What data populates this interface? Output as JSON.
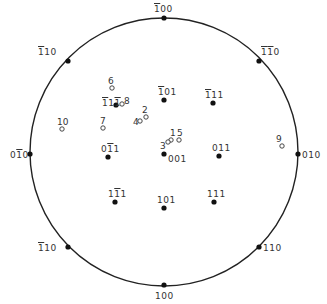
{
  "diagram": {
    "type": "stereographic-projection",
    "circle": {
      "cx": 164,
      "cy": 152,
      "r": 134,
      "stroke": "#222222"
    },
    "poles": [
      {
        "id": "p-100bar",
        "parts": [
          [
            "1",
            true
          ],
          [
            "00",
            false
          ]
        ],
        "x": 164,
        "y": 18,
        "lx": 154,
        "ly": 5
      },
      {
        "id": "p-1bar10",
        "parts": [
          [
            "1",
            true
          ],
          [
            "10",
            false
          ]
        ],
        "x": 68,
        "y": 61,
        "lx": 38,
        "ly": 48
      },
      {
        "id": "p-1bar1bar0",
        "parts": [
          [
            "1",
            true
          ],
          [
            "1",
            true
          ],
          [
            "0",
            false
          ]
        ],
        "x": 259,
        "y": 61,
        "lx": 261,
        "ly": 48
      },
      {
        "id": "p-010bar",
        "parts": [
          [
            "0",
            false
          ],
          [
            "1",
            true
          ],
          [
            "0",
            false
          ]
        ],
        "x": 30,
        "y": 154,
        "lx": 10,
        "ly": 151
      },
      {
        "id": "p-010",
        "parts": [
          [
            "010",
            false
          ]
        ],
        "x": 298,
        "y": 154,
        "lx": 302,
        "ly": 151
      },
      {
        "id": "p-11bar0",
        "parts": [
          [
            "1",
            true
          ],
          [
            "10",
            false
          ]
        ],
        "x": 68,
        "y": 247,
        "lx": 38,
        "ly": 244
      },
      {
        "id": "p-110",
        "parts": [
          [
            "110",
            false
          ]
        ],
        "x": 259,
        "y": 247,
        "lx": 263,
        "ly": 244
      },
      {
        "id": "p-100",
        "parts": [
          [
            "100",
            false
          ]
        ],
        "x": 164,
        "y": 285,
        "lx": 155,
        "ly": 292
      },
      {
        "id": "p-1bar11bar",
        "parts": [
          [
            "1",
            true
          ],
          [
            "1",
            false
          ],
          [
            "1",
            true
          ]
        ],
        "x": 116,
        "y": 105,
        "lx": 102,
        "ly": 99
      },
      {
        "id": "p-1bar01",
        "parts": [
          [
            "1",
            true
          ],
          [
            "01",
            false
          ]
        ],
        "x": 164,
        "y": 100,
        "lx": 158,
        "ly": 88
      },
      {
        "id": "p-1bar11",
        "parts": [
          [
            "1",
            true
          ],
          [
            "11",
            false
          ]
        ],
        "x": 213,
        "y": 103,
        "lx": 205,
        "ly": 91
      },
      {
        "id": "p-01bar1",
        "parts": [
          [
            "0",
            false
          ],
          [
            "1",
            true
          ],
          [
            "1",
            false
          ]
        ],
        "x": 108,
        "y": 157,
        "lx": 101,
        "ly": 145
      },
      {
        "id": "p-001",
        "parts": [
          [
            "001",
            false
          ]
        ],
        "x": 164,
        "y": 154,
        "lx": 168,
        "ly": 155
      },
      {
        "id": "p-011",
        "parts": [
          [
            "011",
            false
          ]
        ],
        "x": 219,
        "y": 156,
        "lx": 212,
        "ly": 144
      },
      {
        "id": "p-11bar1",
        "parts": [
          [
            "1",
            false
          ],
          [
            "1",
            true
          ],
          [
            "1",
            false
          ]
        ],
        "x": 115,
        "y": 202,
        "lx": 108,
        "ly": 190
      },
      {
        "id": "p-101",
        "parts": [
          [
            "101",
            false
          ]
        ],
        "x": 164,
        "y": 208,
        "lx": 157,
        "ly": 196
      },
      {
        "id": "p-111",
        "parts": [
          [
            "111",
            false
          ]
        ],
        "x": 214,
        "y": 202,
        "lx": 207,
        "ly": 190
      }
    ],
    "points": [
      {
        "n": "1",
        "x": 171,
        "y": 140,
        "lx": 170,
        "ly": 129
      },
      {
        "n": "2",
        "x": 146,
        "y": 117,
        "lx": 142,
        "ly": 106
      },
      {
        "n": "3",
        "x": 168,
        "y": 142,
        "lx": 160,
        "ly": 142
      },
      {
        "n": "4",
        "x": 140,
        "y": 121,
        "lx": 133,
        "ly": 118
      },
      {
        "n": "5",
        "x": 179,
        "y": 140,
        "lx": 177,
        "ly": 129
      },
      {
        "n": "6",
        "x": 112,
        "y": 88,
        "lx": 108,
        "ly": 77
      },
      {
        "n": "7",
        "x": 103,
        "y": 128,
        "lx": 100,
        "ly": 117
      },
      {
        "n": "8",
        "x": 122,
        "y": 104,
        "lx": 124,
        "ly": 97
      },
      {
        "n": "9",
        "x": 282,
        "y": 146,
        "lx": 276,
        "ly": 135
      },
      {
        "n": "10",
        "x": 62,
        "y": 129,
        "lx": 57,
        "ly": 118
      }
    ]
  }
}
